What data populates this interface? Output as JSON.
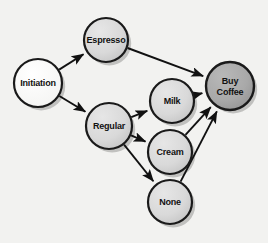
{
  "diagram": {
    "background_color": "#f2f2f0",
    "width": 268,
    "height": 243,
    "colors": {
      "node_start_fill": "#ffffff",
      "node_mid_fill": "#d9d9d9",
      "node_end_fill": "#a9a9a9",
      "node_stroke": "#1a1a1a",
      "edge_stroke": "#111111",
      "label_text": "#111111",
      "shadow": "#b9b9b6"
    },
    "nodes": [
      {
        "id": "initiation",
        "label": "Initiation",
        "lines": [
          "Initiation"
        ],
        "cx": 38,
        "cy": 83,
        "r": 24,
        "fill": "#ffffff",
        "stroke_width": 2.2,
        "font_size": 9
      },
      {
        "id": "espresso",
        "label": "Espresso",
        "lines": [
          "Espresso"
        ],
        "cx": 106,
        "cy": 40,
        "r": 22,
        "fill": "#d9d9d9",
        "stroke_width": 2.2,
        "font_size": 9
      },
      {
        "id": "regular",
        "label": "Regular",
        "lines": [
          "Regular"
        ],
        "cx": 109,
        "cy": 126,
        "r": 23,
        "fill": "#d9d9d9",
        "stroke_width": 2.2,
        "font_size": 9
      },
      {
        "id": "milk",
        "label": "Milk",
        "lines": [
          "Milk"
        ],
        "cx": 172,
        "cy": 101,
        "r": 22,
        "fill": "#d9d9d9",
        "stroke_width": 2.2,
        "font_size": 9
      },
      {
        "id": "cream",
        "label": "Cream",
        "lines": [
          "Cream"
        ],
        "cx": 170,
        "cy": 152,
        "r": 22,
        "fill": "#d9d9d9",
        "stroke_width": 2.2,
        "font_size": 9
      },
      {
        "id": "none",
        "label": "None",
        "lines": [
          "None"
        ],
        "cx": 170,
        "cy": 202,
        "r": 22,
        "fill": "#d9d9d9",
        "stroke_width": 2.2,
        "font_size": 9
      },
      {
        "id": "buy_coffee",
        "label": "Buy Coffee",
        "lines": [
          "Buy",
          "Coffee"
        ],
        "cx": 230,
        "cy": 86,
        "r": 24,
        "fill": "#a9a9a9",
        "stroke_width": 2.4,
        "font_size": 9
      }
    ],
    "edges": [
      {
        "id": "initiation-espresso",
        "from": "initiation",
        "to": "espresso",
        "label": ""
      },
      {
        "id": "initiation-regular",
        "from": "initiation",
        "to": "regular",
        "label": ""
      },
      {
        "id": "espresso-buy_coffee",
        "from": "espresso",
        "to": "buy_coffee",
        "label": ""
      },
      {
        "id": "regular-milk",
        "from": "regular",
        "to": "milk",
        "label": ""
      },
      {
        "id": "regular-cream",
        "from": "regular",
        "to": "cream",
        "label": ""
      },
      {
        "id": "regular-none",
        "from": "regular",
        "to": "none",
        "label": ""
      },
      {
        "id": "milk-buy_coffee",
        "from": "milk",
        "to": "buy_coffee",
        "label": ""
      },
      {
        "id": "cream-buy_coffee",
        "from": "cream",
        "to": "buy_coffee",
        "label": ""
      },
      {
        "id": "none-buy_coffee",
        "from": "none",
        "to": "buy_coffee",
        "label": ""
      }
    ]
  }
}
